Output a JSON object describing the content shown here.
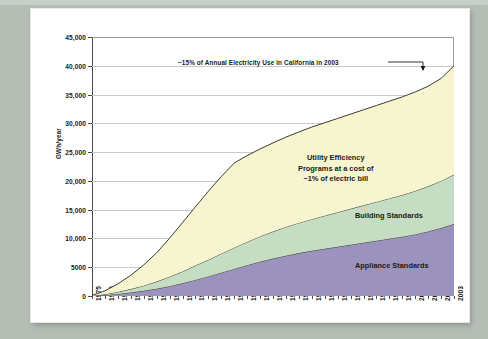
{
  "chart_data": {
    "type": "area",
    "title": "",
    "subtitle": "",
    "xlabel": "",
    "ylabel": "GWh/year",
    "stacked": true,
    "grid": true,
    "legend_position": "inline-band-labels",
    "ylim": [
      0,
      45000
    ],
    "ytick_labels": [
      "45,000",
      "40,000",
      "35,000",
      "30,000",
      "25,000",
      "20,000",
      "15,000",
      "10,000",
      "5000",
      "0"
    ],
    "ytick_values": [
      45000,
      40000,
      35000,
      30000,
      25000,
      20000,
      15000,
      10000,
      5000,
      0
    ],
    "categories": [
      "1975",
      "1976",
      "1977",
      "1978",
      "1979",
      "1980",
      "1981",
      "1982",
      "1983",
      "1984",
      "1985",
      "1986",
      "1987",
      "1988",
      "1989",
      "1990",
      "1991",
      "1992",
      "1993",
      "1994",
      "1995",
      "1996",
      "1997",
      "1998",
      "1999",
      "2000",
      "2001",
      "2002",
      "2003"
    ],
    "series": [
      {
        "name": "Appliance Standards",
        "color": "#9b93bd",
        "values": [
          0,
          150,
          350,
          600,
          900,
          1250,
          1700,
          2200,
          2800,
          3400,
          4050,
          4700,
          5350,
          5950,
          6500,
          7000,
          7450,
          7850,
          8200,
          8550,
          8900,
          9250,
          9600,
          9950,
          10300,
          10700,
          11200,
          11800,
          12500
        ]
      },
      {
        "name": "Building Standards",
        "color": "#c5ddc2",
        "values": [
          0,
          150,
          350,
          600,
          900,
          1250,
          1650,
          2050,
          2500,
          2900,
          3300,
          3700,
          4050,
          4400,
          4700,
          5000,
          5250,
          5500,
          5750,
          6000,
          6250,
          6500,
          6750,
          7000,
          7250,
          7550,
          7850,
          8200,
          8600
        ]
      },
      {
        "name": "Utility Efficiency Programs",
        "color": "#f7f5d0",
        "values": [
          100,
          600,
          1400,
          2400,
          3600,
          5000,
          6700,
          8500,
          10200,
          11900,
          13400,
          14700,
          15000,
          15200,
          15400,
          15600,
          15800,
          16000,
          16150,
          16300,
          16450,
          16600,
          16750,
          16900,
          17050,
          17200,
          17400,
          17800,
          18900
        ]
      }
    ],
    "stack_totals": [
      100,
      900,
      2100,
      3600,
      5400,
      7500,
      10050,
      12750,
      15500,
      18200,
      20750,
      23100,
      24400,
      25550,
      26600,
      27600,
      28500,
      29350,
      30100,
      30850,
      31600,
      32350,
      33100,
      33850,
      34600,
      35450,
      36450,
      37800,
      40000
    ],
    "annotations": [
      {
        "name": "total-callout",
        "text": "~15% of Annual Electricity Use in California in 2003",
        "points_to": "2003 total (~40,000 GWh/year)"
      },
      {
        "name": "utility-efficiency-label",
        "text_lines": [
          "Utility Efficiency",
          "Programs at a cost of",
          "~1% of electric bill"
        ]
      },
      {
        "name": "building-standards-label",
        "text": "Building Standards"
      },
      {
        "name": "appliance-standards-label",
        "text": "Appliance Standards"
      }
    ]
  },
  "labels": {
    "y_axis_title": "GWh/year",
    "utility_line1": "Utility Efficiency",
    "utility_line2": "Programs at a cost of",
    "utility_line3": "~1% of electric bill",
    "building": "Building Standards",
    "appliance": "Appliance Standards",
    "callout": "~15% of Annual Electricity Use in California in 2003"
  },
  "colors": {
    "appliance": "#9b93bd",
    "building": "#c5ddc2",
    "utility": "#f7f5d0",
    "outline": "#3c3c32",
    "grid": "#c9c9c9",
    "axis": "#4a4a4a",
    "mat": "#b5bdb5",
    "card": "#ffffff"
  }
}
